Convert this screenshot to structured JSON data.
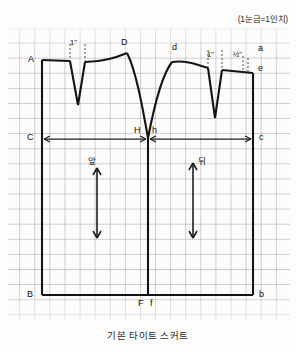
{
  "header": {
    "unit_note": "(1눈금=1인치)"
  },
  "caption": {
    "title": "기본 타이트 스커트"
  },
  "drawing": {
    "type": "sewing-pattern-draft",
    "grid_unit_inch": 1,
    "labels": {
      "waist_left": "A",
      "dart_left_width": "1\"",
      "dart_left_apex": "D",
      "dart_right_apex": "d",
      "dart_right_width": "1\"",
      "side_ease": "½\"",
      "waist_right_upper": "a",
      "waist_right_lower": "e",
      "hip_left": "C",
      "hip_center_left": "H",
      "hip_center_right": "h",
      "hip_right": "c",
      "hem_left": "B",
      "hem_center_left": "F",
      "hem_center_right": "f",
      "hem_right": "b",
      "front_panel": "앞",
      "back_panel": "뒤"
    }
  }
}
